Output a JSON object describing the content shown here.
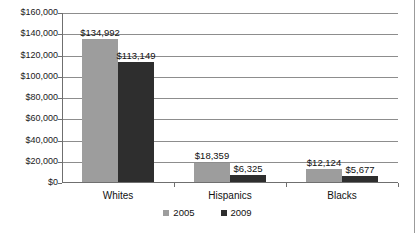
{
  "chart_data": {
    "type": "bar",
    "title": "",
    "xlabel": "",
    "ylabel": "",
    "categories": [
      "Whites",
      "Hispanics",
      "Blacks"
    ],
    "series": [
      {
        "name": "2005",
        "color": "#9d9d9d",
        "values": [
          134992,
          18359,
          12124
        ],
        "labels": [
          "$134,992",
          "$18,359",
          "$12,124"
        ]
      },
      {
        "name": "2009",
        "color": "#2e2e2e",
        "values": [
          113149,
          6325,
          5677
        ],
        "labels": [
          "$113,149",
          "$6,325",
          "$5,677"
        ]
      }
    ],
    "ylim": [
      0,
      160000
    ],
    "ytick_values": [
      0,
      20000,
      40000,
      60000,
      80000,
      100000,
      120000,
      140000,
      160000
    ],
    "ytick_labels": [
      "$0",
      "$20,000",
      "$40,000",
      "$60,000",
      "$80,000",
      "$100,000",
      "$120,000",
      "$140,000",
      "$160,000"
    ],
    "grid": true,
    "legend_position": "bottom"
  },
  "legend": {
    "items": [
      {
        "label": "2005",
        "swatch_name": "legend-swatch-2005"
      },
      {
        "label": "2009",
        "swatch_name": "legend-swatch-2009"
      }
    ]
  }
}
